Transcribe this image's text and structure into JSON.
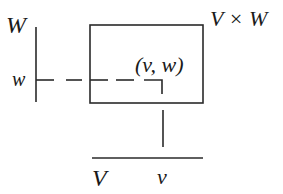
{
  "diagram": {
    "labels": {
      "W_axis": "W",
      "w_point": "w",
      "product_space": "V × W",
      "pair": "(v, w)",
      "V_axis": "V",
      "v_point": "v"
    },
    "colors": {
      "stroke": "#2a2a2a",
      "text": "#1a1a1a",
      "background": "#ffffff"
    }
  }
}
